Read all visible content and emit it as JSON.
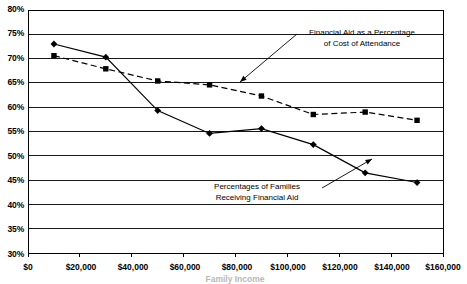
{
  "chart_data": {
    "type": "line",
    "title": "",
    "subtitle": "",
    "xlabel": "Family Income",
    "ylabel": "",
    "xlim": [
      0,
      160000
    ],
    "ylim": [
      0.3,
      0.8
    ],
    "grid": true,
    "grid_axis": "y",
    "legend_position": "none",
    "x_tick_labels": [
      "$0",
      "$20,000",
      "$40,000",
      "$60,000",
      "$80,000",
      "$100,000",
      "$120,000",
      "$140,000",
      "$160,000"
    ],
    "x_tick_values": [
      0,
      20000,
      40000,
      60000,
      80000,
      100000,
      120000,
      140000,
      160000
    ],
    "y_tick_labels": [
      "30%",
      "35%",
      "40%",
      "45%",
      "50%",
      "55%",
      "60%",
      "65%",
      "70%",
      "75%",
      "80%"
    ],
    "y_tick_values": [
      30,
      35,
      40,
      45,
      50,
      55,
      60,
      65,
      70,
      75,
      80
    ],
    "x": [
      10000,
      30000,
      50000,
      70000,
      90000,
      110000,
      130000,
      150000
    ],
    "series": [
      {
        "name": "Percentages of Families Receiving Financial Aid",
        "style": "solid",
        "marker": "diamond",
        "color": "#000000",
        "values": [
          73.0,
          70.3,
          59.3,
          54.6,
          55.6,
          52.3,
          46.5,
          44.5
        ]
      },
      {
        "name": "Financial Aid as a Percentage of Cost of Attendance",
        "style": "dashed",
        "marker": "square",
        "color": "#000000",
        "values": [
          70.6,
          67.9,
          65.4,
          64.6,
          62.3,
          58.5,
          59.0,
          57.3
        ]
      }
    ],
    "annotations": [
      {
        "id": "aid-pct-cost",
        "line1": "Financial Aid as a Percentage",
        "line2": "of Cost of Attendance",
        "text_x": 362,
        "text_y": 35,
        "leader_from_x": 297,
        "leader_from_y": 34,
        "leader_to_x": 240,
        "leader_to_y": 82
      },
      {
        "id": "pct-families-aid",
        "line1": "Percentages of Families",
        "line2": "Receiving Financial Aid",
        "text_x": 257,
        "text_y": 188,
        "leader_from_x": 322,
        "leader_from_y": 188,
        "leader_to_x": 372,
        "leader_to_y": 159
      }
    ]
  },
  "axis": {
    "y_labels": [
      "80%",
      "75%",
      "70%",
      "65%",
      "60%",
      "55%",
      "50%",
      "45%",
      "40%",
      "35%",
      "30%"
    ],
    "x_labels": [
      "$0",
      "$20,000",
      "$40,000",
      "$60,000",
      "$80,000",
      "$100,000",
      "$120,000",
      "$140,000",
      "$160,000"
    ],
    "x_axis_title": "Family Income"
  }
}
